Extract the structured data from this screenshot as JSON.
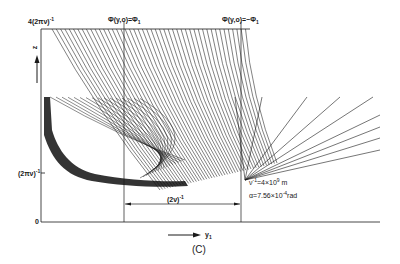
{
  "figure": {
    "caption": "(C)",
    "y_axis": {
      "label": "z",
      "top_label": "4(2πν)",
      "top_label_exp": "-1",
      "mid_label": "(2πν)",
      "mid_label_exp": "-1",
      "zero_label": "0"
    },
    "x_axis": {
      "label": "y",
      "label_sub": "1"
    },
    "vertical_markers": [
      {
        "label": "Φ(y,o)=Φ",
        "sub": "1"
      },
      {
        "label": "Φ(y,o)=−Φ",
        "sub": "1"
      }
    ],
    "span_label": "(2ν)",
    "span_label_exp": "-1",
    "parameters": {
      "line1_prefix": "ν",
      "line1_exp": "-1",
      "line1_mid": "=4×10",
      "line1_exp2": "9",
      "line1_suffix": " m",
      "line2_prefix": "α=7.56×10",
      "line2_exp": "-4",
      "line2_suffix": "rad"
    },
    "colors": {
      "ink": "#1a1a1a",
      "background": "#ffffff"
    }
  }
}
